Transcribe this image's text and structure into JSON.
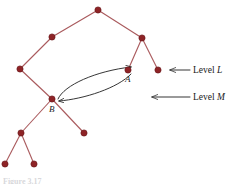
{
  "figure": {
    "caption": "Figure 3.17",
    "colors": {
      "node_fill": "#8e2326",
      "node_stroke": "#6d1a1c",
      "tree_edge": "#a9595c",
      "arrow": "#2b2b2b",
      "text": "#1a1a1a",
      "background": "#ffffff"
    },
    "nodes": [
      {
        "id": "root",
        "x": 98,
        "y": 10,
        "label": ""
      },
      {
        "id": "n2",
        "x": 52,
        "y": 37,
        "label": ""
      },
      {
        "id": "n3",
        "x": 20,
        "y": 69,
        "label": ""
      },
      {
        "id": "n4",
        "x": 142,
        "y": 38,
        "label": ""
      },
      {
        "id": "A",
        "x": 128,
        "y": 70,
        "label": "A"
      },
      {
        "id": "nR",
        "x": 158,
        "y": 70,
        "label": ""
      },
      {
        "id": "B",
        "x": 52,
        "y": 99,
        "label": "B"
      },
      {
        "id": "bR",
        "x": 84,
        "y": 133,
        "label": ""
      },
      {
        "id": "bL",
        "x": 21,
        "y": 133,
        "label": ""
      },
      {
        "id": "ll",
        "x": 5,
        "y": 164,
        "label": ""
      },
      {
        "id": "lr",
        "x": 34,
        "y": 164,
        "label": ""
      }
    ],
    "edges": [
      {
        "from": "root",
        "to": "n2"
      },
      {
        "from": "n2",
        "to": "n3"
      },
      {
        "from": "n3",
        "to": "B"
      },
      {
        "from": "root",
        "to": "n4"
      },
      {
        "from": "n4",
        "to": "A"
      },
      {
        "from": "n4",
        "to": "nR"
      },
      {
        "from": "B",
        "to": "bL"
      },
      {
        "from": "B",
        "to": "bR"
      },
      {
        "from": "bL",
        "to": "ll"
      },
      {
        "from": "bL",
        "to": "lr"
      }
    ],
    "node_labels": [
      {
        "text": "A",
        "x": 125,
        "y": 75
      },
      {
        "text": "B",
        "x": 49,
        "y": 105
      }
    ],
    "curved_arrows": [
      {
        "id": "b-to-a",
        "direction": "B to A",
        "path": "M 58 99 C 64 85, 96 71, 131 67"
      },
      {
        "id": "a-to-b",
        "direction": "A to B",
        "path": "M 131 74 C 118 88, 84 99, 59 101"
      }
    ],
    "level_markers": [
      {
        "id": "level-l",
        "text_prefix": "Level ",
        "text_italic": "L",
        "arrow_from_x": 190,
        "arrow_to_x": 170,
        "arrow_y": 70,
        "text_x": 193,
        "text_y": 66
      },
      {
        "id": "level-m",
        "text_prefix": "Level ",
        "text_italic": "M",
        "arrow_from_x": 190,
        "arrow_to_x": 152,
        "arrow_y": 97,
        "text_x": 193,
        "text_y": 93
      }
    ]
  }
}
